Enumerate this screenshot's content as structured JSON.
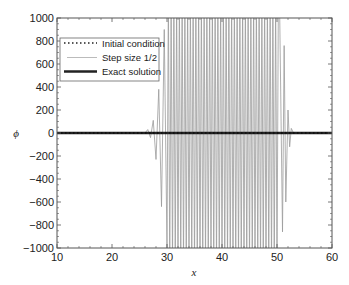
{
  "chart_data": {
    "type": "line",
    "title": "",
    "xlabel": "x",
    "ylabel": "ϕ",
    "xlim": [
      10,
      60
    ],
    "ylim": [
      -1000,
      1000
    ],
    "xticks": [
      10,
      20,
      30,
      40,
      50,
      60
    ],
    "yticks": [
      -1000,
      -800,
      -600,
      -400,
      -200,
      0,
      200,
      400,
      600,
      800,
      1000
    ],
    "grid": false,
    "legend_position": "upper left",
    "series": [
      {
        "name": "Initial condition",
        "style": "dotted",
        "color": "#222222",
        "x": [
          10,
          60
        ],
        "y": [
          0,
          0
        ]
      },
      {
        "name": "Step size 1/2",
        "style": "thin solid",
        "color": "#9a9a9a",
        "description": "Numerical solution oscillating with growing amplitude; small oscillations begin near x=26, full-range (clipped beyond ±1000) oscillations from about x=30 to x=50.5, decaying tail to x=53",
        "x": [
          10,
          26,
          26.5,
          27,
          27.5,
          28,
          28.5,
          29,
          29.5,
          30,
          50.5,
          51,
          51.3,
          51.6,
          52,
          52.3,
          52.6,
          53,
          60
        ],
        "y": [
          0,
          0,
          30,
          -40,
          110,
          -230,
          380,
          -640,
          900,
          -1000,
          1000,
          -860,
          760,
          -600,
          200,
          -120,
          40,
          0,
          0
        ]
      },
      {
        "name": "Exact solution",
        "style": "thick solid",
        "color": "#222222",
        "x": [
          10,
          60
        ],
        "y": [
          0,
          0
        ]
      }
    ],
    "oscillation_region": {
      "start_x": 30,
      "end_x": 50.5,
      "spacing": 0.5,
      "amplitude_clipped": true
    }
  },
  "legend": {
    "items": [
      {
        "label": "Initial condition",
        "style": "dotted"
      },
      {
        "label": "Step size 1/2",
        "style": "thin"
      },
      {
        "label": "Exact solution",
        "style": "thick"
      }
    ]
  },
  "axes": {
    "xlabel": "x",
    "ylabel": "ϕ",
    "xtick_labels": [
      "10",
      "20",
      "30",
      "40",
      "50",
      "60"
    ],
    "ytick_labels": [
      "−1000",
      "−800",
      "−600",
      "−400",
      "−200",
      "0",
      "200",
      "400",
      "600",
      "800",
      "1000"
    ]
  }
}
